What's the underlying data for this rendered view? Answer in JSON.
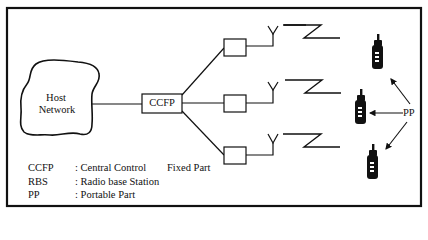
{
  "diagram": {
    "type": "network-architecture",
    "nodes": {
      "host_network": {
        "line1": "Host",
        "line2": "Network"
      },
      "ccfp": {
        "label": "CCFP"
      },
      "rbs": [
        {
          "label": ""
        },
        {
          "label": ""
        },
        {
          "label": ""
        }
      ],
      "portable_parts": {
        "label": "PP",
        "count": 3
      }
    },
    "legend": [
      {
        "abbr": "CCFP",
        "desc": ": Central Control",
        "extra": "Fixed Part"
      },
      {
        "abbr": "RBS",
        "desc": ": Radio base Station",
        "extra": ""
      },
      {
        "abbr": "PP",
        "desc": ": Portable Part",
        "extra": ""
      }
    ],
    "colors": {
      "stroke": "#111111",
      "background": "#ffffff"
    }
  }
}
